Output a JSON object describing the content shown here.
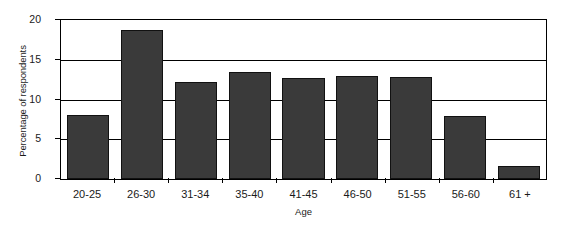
{
  "chart_data": {
    "type": "bar",
    "title": "",
    "subtitle": "",
    "xlabel": "Age",
    "ylabel": "Percentage of respondents",
    "categories": [
      "20-25",
      "26-30",
      "31-34",
      "35-40",
      "41-45",
      "46-50",
      "51-55",
      "56-60",
      "61 +"
    ],
    "values": [
      8.0,
      18.7,
      12.2,
      13.5,
      12.7,
      13.0,
      12.8,
      7.9,
      1.6
    ],
    "ylim": [
      0,
      20
    ],
    "yticks": [
      0,
      5,
      10,
      15,
      20
    ],
    "ytick_labels": [
      "0",
      "5",
      "10",
      "15",
      "20"
    ],
    "gridlines": [
      5,
      10,
      15,
      20
    ],
    "grid": true,
    "legend": false,
    "legend_position": "none",
    "bar_color": "#3a3a3a",
    "bar_edge_color": "#111111",
    "axis_color": "#000000",
    "background_color": "#ffffff"
  }
}
